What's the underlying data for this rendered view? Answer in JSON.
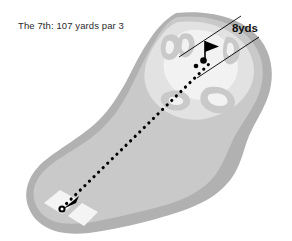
{
  "diagram": {
    "kind": "golf-hole-yardage-diagram",
    "title": "The 7th: 107 yards par 3",
    "hole_number": "7th",
    "yardage": "107 yards",
    "par": "par 3",
    "green_width_label": "8yds",
    "background_color": "#ffffff",
    "colors": {
      "rough": "#b1b1b1",
      "fairway": "#c9c9c9",
      "green_surround": "#e2e2e2",
      "green": "#f2f2f2",
      "bunker": "#c9c9c9",
      "tee_box": "#f4f4f4",
      "ink": "#000000",
      "title_text": "#2b2b2b",
      "dimension_text": "#111111"
    },
    "features": {
      "rough_name": "rough-outline",
      "fairway_name": "fairway",
      "green_name": "putting-green",
      "bunkers_name": "greenside-bunkers",
      "flag_name": "flagstick",
      "ball_name": "ball-marker",
      "tee_name": "tee-boxes",
      "shot_line_name": "shot-line"
    },
    "shot_line": {
      "from_x": 62,
      "from_y": 208,
      "to_x": 211,
      "to_y": 62,
      "style": "dotted"
    },
    "flag": {
      "x": 205,
      "y": 49
    },
    "ball_positions": [
      {
        "x": 203,
        "y": 60
      },
      {
        "x": 197,
        "y": 65
      }
    ],
    "tee_boxes": [
      {
        "x": 60,
        "y": 202
      },
      {
        "x": 79,
        "y": 213
      }
    ],
    "dimension_lines": [
      {
        "x1": 179,
        "y1": 56,
        "x2": 240,
        "y2": 17
      },
      {
        "x1": 196,
        "y1": 77,
        "x2": 258,
        "y2": 38
      }
    ]
  }
}
